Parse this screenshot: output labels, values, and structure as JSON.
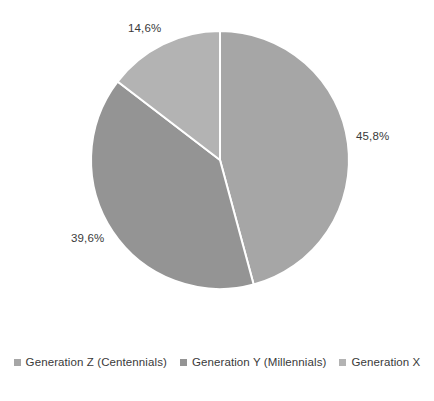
{
  "chart_data": {
    "type": "pie",
    "title": "",
    "subtitle": "",
    "xlabel": "",
    "ylabel": "",
    "grid": false,
    "legend_position": "bottom",
    "start_angle_deg": 0,
    "direction": "clockwise",
    "center": {
      "x": 220,
      "y": 160
    },
    "radius": 129,
    "slice_border_color": "#ffffff",
    "background_color": "#ffffff",
    "categories": [
      "Generation Z (Centennials)",
      "Generation Y (Millennials)",
      "Generation X"
    ],
    "values": [
      45.8,
      39.6,
      14.6
    ],
    "labels": [
      "45,8%",
      "39,6%",
      "14,6%"
    ],
    "colors": [
      "#a6a6a6",
      "#949494",
      "#b3b3b3"
    ],
    "slices": [
      {
        "name": "Generation Z (Centennials)",
        "value": 45.8,
        "label": "45,8%",
        "color": "#a6a6a6",
        "start_deg": 0.0,
        "end_deg": 164.88
      },
      {
        "name": "Generation Y (Millennials)",
        "value": 39.6,
        "label": "39,6%",
        "color": "#949494",
        "start_deg": 164.88,
        "end_deg": 307.44
      },
      {
        "name": "Generation X",
        "value": 14.6,
        "label": "14,6%",
        "color": "#b3b3b3",
        "start_deg": 307.44,
        "end_deg": 360.0
      }
    ]
  },
  "labels": {
    "slice_1": "45,8%",
    "slice_2": "39,6%",
    "slice_3": "14,6%"
  },
  "legend": {
    "items": [
      {
        "label": "Generation Z (Centennials)",
        "color": "#a6a6a6"
      },
      {
        "label": "Generation Y (Millennials)",
        "color": "#949494"
      },
      {
        "label": "Generation X",
        "color": "#b3b3b3"
      }
    ]
  }
}
